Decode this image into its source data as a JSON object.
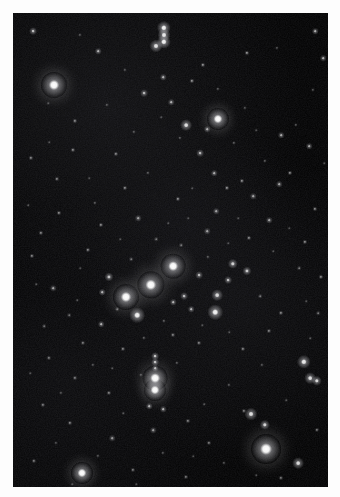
{
  "image": {
    "title": "Open star cluster field",
    "subject": "night-sky star field photograph",
    "width": 340,
    "height": 497,
    "border_color": "#fdfdfd",
    "sky_color": "#000000",
    "star_color": "#ffffff",
    "field": {
      "left": 13,
      "top": 13,
      "width": 315,
      "height": 474
    },
    "noise_opacity": 0.5
  },
  "chart_data": {
    "type": "scatter",
    "xlabel": "",
    "ylabel": "",
    "xlim": [
      0,
      315
    ],
    "ylim": [
      0,
      474
    ],
    "grid": false,
    "legend": "none",
    "note": "Each point is a star: x,y are pixel coordinates inside the dark field; r is the apparent radius in pixels; b is normalized brightness 0-1.",
    "stars": [
      {
        "x": 41,
        "y": 72,
        "r": 10.0,
        "b": 1.0
      },
      {
        "x": 205,
        "y": 106,
        "r": 8.5,
        "b": 1.0
      },
      {
        "x": 160,
        "y": 253,
        "r": 9.5,
        "b": 1.0
      },
      {
        "x": 138,
        "y": 272,
        "r": 10.5,
        "b": 1.0
      },
      {
        "x": 113,
        "y": 284,
        "r": 10.0,
        "b": 1.0
      },
      {
        "x": 142,
        "y": 365,
        "r": 9.5,
        "b": 1.0
      },
      {
        "x": 142,
        "y": 377,
        "r": 8.5,
        "b": 1.0
      },
      {
        "x": 253,
        "y": 436,
        "r": 11.5,
        "b": 1.0
      },
      {
        "x": 69,
        "y": 460,
        "r": 8.5,
        "b": 1.0
      },
      {
        "x": 124,
        "y": 302,
        "r": 6.0,
        "b": 0.95
      },
      {
        "x": 202,
        "y": 299,
        "r": 6.0,
        "b": 0.95
      },
      {
        "x": 151,
        "y": 15,
        "r": 5.5,
        "b": 0.95
      },
      {
        "x": 151,
        "y": 22,
        "r": 5.0,
        "b": 0.92
      },
      {
        "x": 151,
        "y": 29,
        "r": 5.5,
        "b": 0.95
      },
      {
        "x": 143,
        "y": 33,
        "r": 5.0,
        "b": 0.9
      },
      {
        "x": 173,
        "y": 112,
        "r": 4.5,
        "b": 0.88
      },
      {
        "x": 291,
        "y": 349,
        "r": 5.5,
        "b": 0.92
      },
      {
        "x": 297,
        "y": 365,
        "r": 4.5,
        "b": 0.88
      },
      {
        "x": 304,
        "y": 368,
        "r": 4.0,
        "b": 0.85
      },
      {
        "x": 238,
        "y": 401,
        "r": 5.0,
        "b": 0.88
      },
      {
        "x": 252,
        "y": 412,
        "r": 4.0,
        "b": 0.84
      },
      {
        "x": 285,
        "y": 450,
        "r": 4.5,
        "b": 0.86
      },
      {
        "x": 220,
        "y": 251,
        "r": 4.0,
        "b": 0.82
      },
      {
        "x": 234,
        "y": 258,
        "r": 3.5,
        "b": 0.8
      },
      {
        "x": 204,
        "y": 282,
        "r": 4.5,
        "b": 0.85
      },
      {
        "x": 215,
        "y": 267,
        "r": 3.0,
        "b": 0.76
      },
      {
        "x": 186,
        "y": 262,
        "r": 3.0,
        "b": 0.74
      },
      {
        "x": 171,
        "y": 283,
        "r": 3.0,
        "b": 0.74
      },
      {
        "x": 160,
        "y": 289,
        "r": 2.5,
        "b": 0.7
      },
      {
        "x": 178,
        "y": 296,
        "r": 2.5,
        "b": 0.7
      },
      {
        "x": 96,
        "y": 264,
        "r": 3.5,
        "b": 0.78
      },
      {
        "x": 89,
        "y": 279,
        "r": 2.5,
        "b": 0.7
      },
      {
        "x": 88,
        "y": 311,
        "r": 2.5,
        "b": 0.68
      },
      {
        "x": 142,
        "y": 343,
        "r": 3.0,
        "b": 0.78
      },
      {
        "x": 142,
        "y": 349,
        "r": 3.0,
        "b": 0.76
      },
      {
        "x": 142,
        "y": 355,
        "r": 2.5,
        "b": 0.72
      },
      {
        "x": 136,
        "y": 393,
        "r": 2.5,
        "b": 0.7
      },
      {
        "x": 150,
        "y": 396,
        "r": 2.5,
        "b": 0.68
      },
      {
        "x": 150,
        "y": 64,
        "r": 2.5,
        "b": 0.7
      },
      {
        "x": 85,
        "y": 38,
        "r": 2.5,
        "b": 0.7
      },
      {
        "x": 20,
        "y": 18,
        "r": 3.0,
        "b": 0.76
      },
      {
        "x": 302,
        "y": 18,
        "r": 2.5,
        "b": 0.7
      },
      {
        "x": 310,
        "y": 45,
        "r": 2.5,
        "b": 0.68
      },
      {
        "x": 234,
        "y": 40,
        "r": 2.0,
        "b": 0.62
      },
      {
        "x": 190,
        "y": 52,
        "r": 2.0,
        "b": 0.6
      },
      {
        "x": 179,
        "y": 68,
        "r": 2.0,
        "b": 0.6
      },
      {
        "x": 131,
        "y": 80,
        "r": 3.0,
        "b": 0.72
      },
      {
        "x": 158,
        "y": 89,
        "r": 2.5,
        "b": 0.68
      },
      {
        "x": 194,
        "y": 116,
        "r": 2.5,
        "b": 0.66
      },
      {
        "x": 268,
        "y": 122,
        "r": 2.5,
        "b": 0.66
      },
      {
        "x": 187,
        "y": 140,
        "r": 3.0,
        "b": 0.72
      },
      {
        "x": 201,
        "y": 160,
        "r": 2.5,
        "b": 0.66
      },
      {
        "x": 214,
        "y": 175,
        "r": 2.0,
        "b": 0.6
      },
      {
        "x": 229,
        "y": 168,
        "r": 2.0,
        "b": 0.58
      },
      {
        "x": 240,
        "y": 183,
        "r": 2.5,
        "b": 0.64
      },
      {
        "x": 266,
        "y": 171,
        "r": 2.5,
        "b": 0.64
      },
      {
        "x": 277,
        "y": 160,
        "r": 2.0,
        "b": 0.58
      },
      {
        "x": 296,
        "y": 133,
        "r": 2.5,
        "b": 0.66
      },
      {
        "x": 256,
        "y": 207,
        "r": 2.5,
        "b": 0.64
      },
      {
        "x": 203,
        "y": 198,
        "r": 2.5,
        "b": 0.62
      },
      {
        "x": 194,
        "y": 218,
        "r": 2.5,
        "b": 0.62
      },
      {
        "x": 165,
        "y": 186,
        "r": 2.0,
        "b": 0.58
      },
      {
        "x": 112,
        "y": 175,
        "r": 2.0,
        "b": 0.56
      },
      {
        "x": 125,
        "y": 205,
        "r": 2.5,
        "b": 0.62
      },
      {
        "x": 88,
        "y": 212,
        "r": 2.0,
        "b": 0.56
      },
      {
        "x": 46,
        "y": 200,
        "r": 2.0,
        "b": 0.56
      },
      {
        "x": 28,
        "y": 220,
        "r": 2.0,
        "b": 0.54
      },
      {
        "x": 75,
        "y": 237,
        "r": 2.0,
        "b": 0.56
      },
      {
        "x": 40,
        "y": 275,
        "r": 2.5,
        "b": 0.62
      },
      {
        "x": 19,
        "y": 243,
        "r": 2.0,
        "b": 0.54
      },
      {
        "x": 18,
        "y": 145,
        "r": 2.0,
        "b": 0.54
      },
      {
        "x": 60,
        "y": 137,
        "r": 2.0,
        "b": 0.54
      },
      {
        "x": 103,
        "y": 141,
        "r": 2.0,
        "b": 0.54
      },
      {
        "x": 62,
        "y": 108,
        "r": 2.0,
        "b": 0.54
      },
      {
        "x": 44,
        "y": 166,
        "r": 2.0,
        "b": 0.52
      },
      {
        "x": 236,
        "y": 225,
        "r": 2.0,
        "b": 0.56
      },
      {
        "x": 292,
        "y": 229,
        "r": 2.0,
        "b": 0.56
      },
      {
        "x": 302,
        "y": 196,
        "r": 2.0,
        "b": 0.56
      },
      {
        "x": 308,
        "y": 264,
        "r": 2.0,
        "b": 0.54
      },
      {
        "x": 268,
        "y": 300,
        "r": 2.0,
        "b": 0.54
      },
      {
        "x": 256,
        "y": 318,
        "r": 2.0,
        "b": 0.52
      },
      {
        "x": 230,
        "y": 336,
        "r": 2.0,
        "b": 0.52
      },
      {
        "x": 186,
        "y": 330,
        "r": 2.0,
        "b": 0.52
      },
      {
        "x": 160,
        "y": 322,
        "r": 2.0,
        "b": 0.52
      },
      {
        "x": 110,
        "y": 336,
        "r": 2.0,
        "b": 0.52
      },
      {
        "x": 70,
        "y": 330,
        "r": 2.0,
        "b": 0.5
      },
      {
        "x": 36,
        "y": 345,
        "r": 2.0,
        "b": 0.5
      },
      {
        "x": 62,
        "y": 365,
        "r": 2.0,
        "b": 0.5
      },
      {
        "x": 96,
        "y": 380,
        "r": 2.0,
        "b": 0.52
      },
      {
        "x": 30,
        "y": 392,
        "r": 2.0,
        "b": 0.5
      },
      {
        "x": 57,
        "y": 410,
        "r": 2.0,
        "b": 0.52
      },
      {
        "x": 99,
        "y": 425,
        "r": 2.5,
        "b": 0.58
      },
      {
        "x": 140,
        "y": 417,
        "r": 2.5,
        "b": 0.58
      },
      {
        "x": 175,
        "y": 408,
        "r": 2.0,
        "b": 0.52
      },
      {
        "x": 196,
        "y": 430,
        "r": 2.0,
        "b": 0.5
      },
      {
        "x": 231,
        "y": 398,
        "r": 2.0,
        "b": 0.5
      },
      {
        "x": 21,
        "y": 448,
        "r": 2.0,
        "b": 0.5
      },
      {
        "x": 120,
        "y": 457,
        "r": 2.0,
        "b": 0.48
      },
      {
        "x": 173,
        "y": 464,
        "r": 2.0,
        "b": 0.48
      },
      {
        "x": 304,
        "y": 417,
        "r": 2.0,
        "b": 0.48
      },
      {
        "x": 268,
        "y": 465,
        "r": 2.0,
        "b": 0.48
      },
      {
        "x": 305,
        "y": 300,
        "r": 1.8,
        "b": 0.46
      },
      {
        "x": 286,
        "y": 255,
        "r": 1.8,
        "b": 0.46
      },
      {
        "x": 247,
        "y": 283,
        "r": 1.8,
        "b": 0.44
      },
      {
        "x": 168,
        "y": 232,
        "r": 1.8,
        "b": 0.44
      },
      {
        "x": 143,
        "y": 226,
        "r": 1.8,
        "b": 0.44
      },
      {
        "x": 118,
        "y": 246,
        "r": 1.8,
        "b": 0.44
      },
      {
        "x": 104,
        "y": 296,
        "r": 1.8,
        "b": 0.44
      },
      {
        "x": 56,
        "y": 302,
        "r": 1.8,
        "b": 0.42
      },
      {
        "x": 31,
        "y": 313,
        "r": 1.8,
        "b": 0.42
      },
      {
        "x": 82,
        "y": 190,
        "r": 1.6,
        "b": 0.4
      },
      {
        "x": 135,
        "y": 160,
        "r": 1.6,
        "b": 0.4
      },
      {
        "x": 221,
        "y": 130,
        "r": 1.6,
        "b": 0.4
      },
      {
        "x": 252,
        "y": 148,
        "r": 1.6,
        "b": 0.4
      },
      {
        "x": 283,
        "y": 112,
        "r": 1.6,
        "b": 0.38
      },
      {
        "x": 167,
        "y": 125,
        "r": 1.6,
        "b": 0.38
      },
      {
        "x": 121,
        "y": 119,
        "r": 1.6,
        "b": 0.38
      },
      {
        "x": 94,
        "y": 92,
        "r": 1.6,
        "b": 0.38
      },
      {
        "x": 205,
        "y": 76,
        "r": 1.6,
        "b": 0.38
      },
      {
        "x": 232,
        "y": 95,
        "r": 1.6,
        "b": 0.36
      },
      {
        "x": 300,
        "y": 77,
        "r": 1.6,
        "b": 0.36
      },
      {
        "x": 112,
        "y": 57,
        "r": 1.6,
        "b": 0.36
      },
      {
        "x": 67,
        "y": 22,
        "r": 1.6,
        "b": 0.36
      },
      {
        "x": 264,
        "y": 35,
        "r": 1.6,
        "b": 0.36
      },
      {
        "x": 195,
        "y": 244,
        "r": 1.6,
        "b": 0.4
      },
      {
        "x": 151,
        "y": 308,
        "r": 1.6,
        "b": 0.4
      },
      {
        "x": 131,
        "y": 325,
        "r": 1.6,
        "b": 0.4
      },
      {
        "x": 164,
        "y": 350,
        "r": 1.6,
        "b": 0.38
      },
      {
        "x": 128,
        "y": 362,
        "r": 1.6,
        "b": 0.38
      },
      {
        "x": 216,
        "y": 372,
        "r": 1.6,
        "b": 0.36
      },
      {
        "x": 249,
        "y": 352,
        "r": 1.6,
        "b": 0.36
      },
      {
        "x": 80,
        "y": 352,
        "r": 1.6,
        "b": 0.36
      },
      {
        "x": 48,
        "y": 380,
        "r": 1.6,
        "b": 0.36
      },
      {
        "x": 211,
        "y": 450,
        "r": 1.6,
        "b": 0.36
      },
      {
        "x": 150,
        "y": 440,
        "r": 1.6,
        "b": 0.36
      },
      {
        "x": 85,
        "y": 443,
        "r": 1.6,
        "b": 0.36
      },
      {
        "x": 43,
        "y": 430,
        "r": 1.6,
        "b": 0.34
      },
      {
        "x": 297,
        "y": 325,
        "r": 1.4,
        "b": 0.32
      },
      {
        "x": 273,
        "y": 387,
        "r": 1.4,
        "b": 0.32
      },
      {
        "x": 191,
        "y": 391,
        "r": 1.4,
        "b": 0.32
      },
      {
        "x": 110,
        "y": 400,
        "r": 1.4,
        "b": 0.32
      },
      {
        "x": 64,
        "y": 287,
        "r": 1.4,
        "b": 0.32
      },
      {
        "x": 23,
        "y": 271,
        "r": 1.4,
        "b": 0.32
      },
      {
        "x": 15,
        "y": 192,
        "r": 1.4,
        "b": 0.32
      },
      {
        "x": 36,
        "y": 129,
        "r": 1.4,
        "b": 0.3
      },
      {
        "x": 148,
        "y": 104,
        "r": 1.4,
        "b": 0.3
      },
      {
        "x": 243,
        "y": 117,
        "r": 1.4,
        "b": 0.3
      },
      {
        "x": 311,
        "y": 150,
        "r": 1.4,
        "b": 0.3
      },
      {
        "x": 179,
        "y": 175,
        "r": 1.4,
        "b": 0.3
      },
      {
        "x": 225,
        "y": 205,
        "r": 1.4,
        "b": 0.3
      },
      {
        "x": 155,
        "y": 210,
        "r": 1.4,
        "b": 0.3
      },
      {
        "x": 107,
        "y": 226,
        "r": 1.4,
        "b": 0.3
      },
      {
        "x": 67,
        "y": 255,
        "r": 1.4,
        "b": 0.3
      },
      {
        "x": 189,
        "y": 312,
        "r": 1.4,
        "b": 0.3
      },
      {
        "x": 216,
        "y": 319,
        "r": 1.4,
        "b": 0.3
      },
      {
        "x": 99,
        "y": 355,
        "r": 1.4,
        "b": 0.3
      },
      {
        "x": 17,
        "y": 360,
        "r": 1.4,
        "b": 0.3
      },
      {
        "x": 260,
        "y": 238,
        "r": 1.4,
        "b": 0.3
      },
      {
        "x": 276,
        "y": 215,
        "r": 1.4,
        "b": 0.28
      },
      {
        "x": 293,
        "y": 288,
        "r": 1.4,
        "b": 0.28
      },
      {
        "x": 243,
        "y": 462,
        "r": 1.4,
        "b": 0.28
      },
      {
        "x": 180,
        "y": 443,
        "r": 1.4,
        "b": 0.28
      },
      {
        "x": 123,
        "y": 471,
        "r": 1.4,
        "b": 0.28
      },
      {
        "x": 59,
        "y": 471,
        "r": 1.4,
        "b": 0.28
      },
      {
        "x": 35,
        "y": 90,
        "r": 1.4,
        "b": 0.28
      },
      {
        "x": 76,
        "y": 165,
        "r": 1.4,
        "b": 0.28
      },
      {
        "x": 215,
        "y": 230,
        "r": 1.4,
        "b": 0.28
      },
      {
        "x": 175,
        "y": 205,
        "r": 1.4,
        "b": 0.28
      }
    ]
  }
}
